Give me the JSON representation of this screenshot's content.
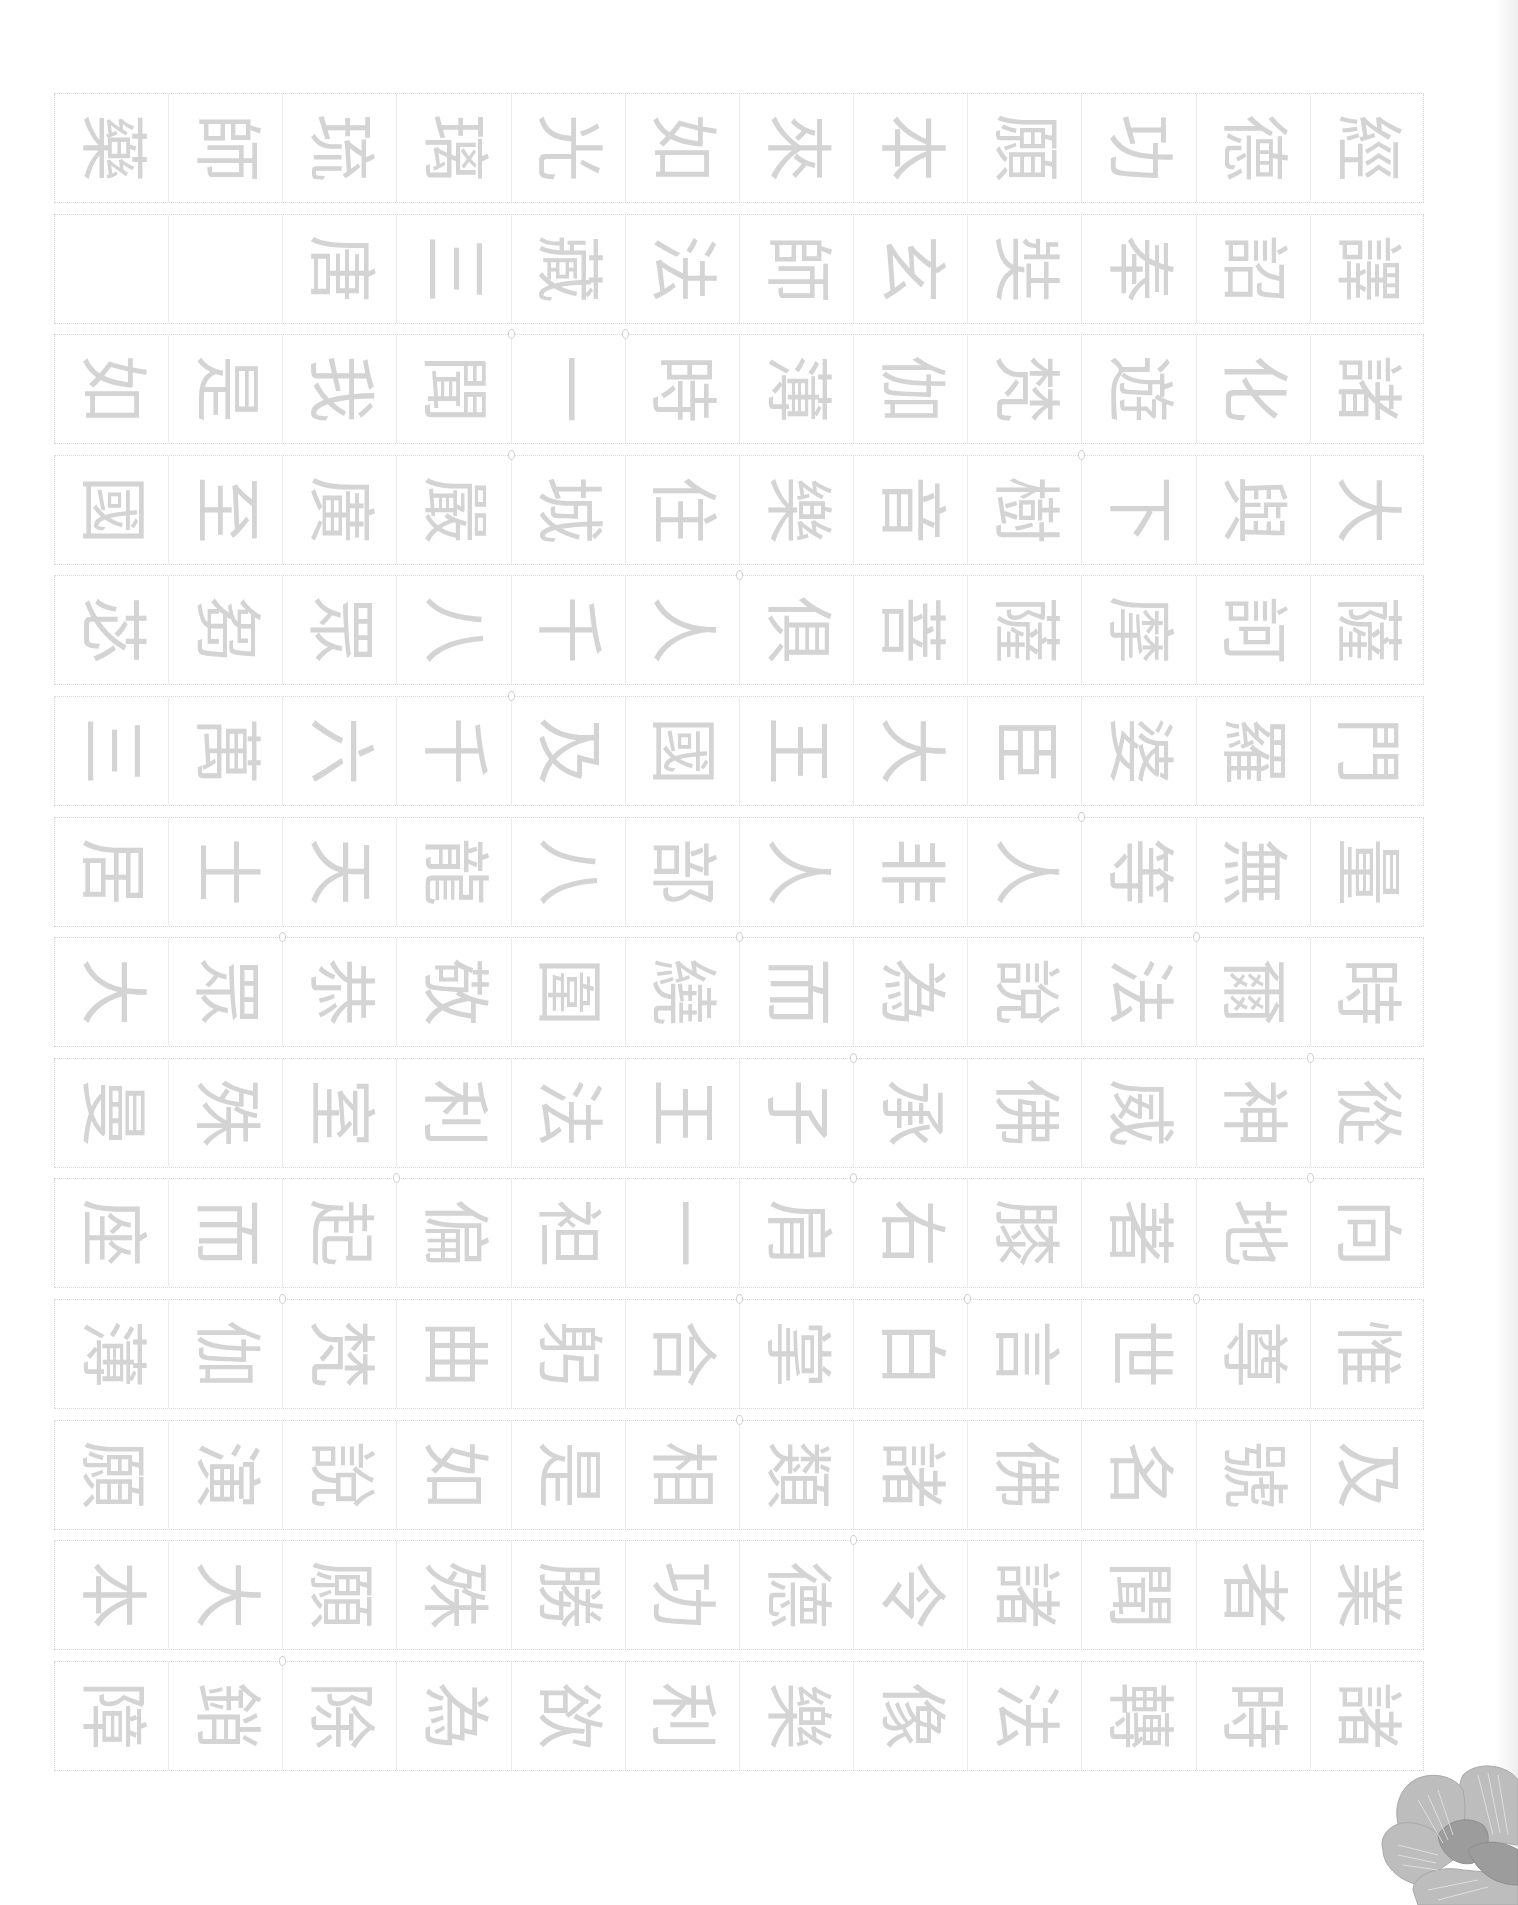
{
  "document": {
    "type": "calligraphy-tracing-sheet",
    "orientation": "rotated-90-clockwise",
    "columns_per_row": 12,
    "colors": {
      "trace_glyph": "#d4d4d4",
      "grid_line": "#d9d9d9",
      "flower_light": "#b9b9b9",
      "flower_dark": "#9c9c9c"
    },
    "rows": [
      [
        "藥",
        "師",
        "琉",
        "璃",
        "光",
        "如",
        "來",
        "本",
        "願",
        "功",
        "德",
        "經"
      ],
      [
        "",
        "",
        "唐",
        "三",
        "藏",
        "法",
        "師",
        "玄",
        "奘",
        "奉",
        "詔",
        "譯"
      ],
      [
        "如",
        "是",
        "我",
        "聞",
        "一",
        "時",
        "薄",
        "伽",
        "梵",
        "遊",
        "化",
        "諸"
      ],
      [
        "國",
        "至",
        "廣",
        "嚴",
        "城",
        "住",
        "樂",
        "音",
        "樹",
        "下",
        "與",
        "大"
      ],
      [
        "苾",
        "芻",
        "眾",
        "八",
        "千",
        "人",
        "俱",
        "菩",
        "薩",
        "摩",
        "訶",
        "薩"
      ],
      [
        "三",
        "萬",
        "六",
        "千",
        "及",
        "國",
        "王",
        "大",
        "臣",
        "婆",
        "羅",
        "門"
      ],
      [
        "居",
        "士",
        "天",
        "龍",
        "八",
        "部",
        "人",
        "非",
        "人",
        "等",
        "無",
        "量"
      ],
      [
        "大",
        "眾",
        "恭",
        "敬",
        "圍",
        "繞",
        "而",
        "為",
        "說",
        "法",
        "爾",
        "時"
      ],
      [
        "曼",
        "殊",
        "室",
        "利",
        "法",
        "王",
        "子",
        "承",
        "佛",
        "威",
        "神",
        "從"
      ],
      [
        "座",
        "而",
        "起",
        "偏",
        "袒",
        "一",
        "肩",
        "右",
        "膝",
        "著",
        "地",
        "向"
      ],
      [
        "薄",
        "伽",
        "梵",
        "曲",
        "躬",
        "合",
        "掌",
        "白",
        "言",
        "世",
        "尊",
        "惟"
      ],
      [
        "願",
        "演",
        "說",
        "如",
        "是",
        "相",
        "類",
        "諸",
        "佛",
        "名",
        "號",
        "及"
      ],
      [
        "本",
        "大",
        "願",
        "殊",
        "勝",
        "功",
        "德",
        "令",
        "諸",
        "聞",
        "者",
        "業"
      ],
      [
        "障",
        "銷",
        "除",
        "為",
        "欲",
        "利",
        "樂",
        "像",
        "法",
        "轉",
        "時",
        "諸"
      ]
    ],
    "decoration": "peony-flower-corner"
  }
}
